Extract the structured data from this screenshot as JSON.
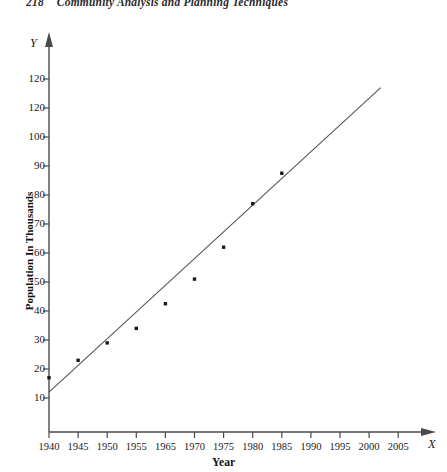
{
  "page": {
    "page_number": "218",
    "running_head": "Community Analysis and Planning Techniques"
  },
  "figure": {
    "y_axis_variable": "Y",
    "x_axis_variable": "X"
  },
  "chart_data": {
    "type": "scatter",
    "title": "",
    "xlabel": "Year",
    "ylabel": "Population In Thousands",
    "x": [
      1940,
      1945,
      1950,
      1955,
      1965,
      1970,
      1975,
      1980,
      1985
    ],
    "values": [
      17,
      23,
      29,
      34,
      42.5,
      51,
      62,
      77,
      87.5
    ],
    "series": [
      {
        "name": "Population observations",
        "type": "scatter",
        "x": [
          1940,
          1945,
          1950,
          1955,
          1965,
          1970,
          1975,
          1980,
          1985
        ],
        "values": [
          17,
          23,
          29,
          34,
          42.5,
          51,
          62,
          77,
          87.5
        ]
      },
      {
        "name": "Fitted trend line",
        "type": "line",
        "x": [
          1940,
          2002
        ],
        "values": [
          12,
          117
        ]
      }
    ],
    "xticks": [
      "1940",
      "1945",
      "1950",
      "1955",
      "1965",
      "1970",
      "1975",
      "1980",
      "1985",
      "1990",
      "1995",
      "2000",
      "2005"
    ],
    "yticks": [
      "10",
      "20",
      "30",
      "40",
      "50",
      "60",
      "70",
      "80",
      "90",
      "100",
      "120",
      "120"
    ],
    "xlim": [
      1940,
      2008
    ],
    "ylim": [
      0,
      125
    ],
    "grid": false,
    "legend": "none",
    "marker_color": "#1a1a1a",
    "line_color": "#555555",
    "axis_color": "#4a4a4a"
  }
}
